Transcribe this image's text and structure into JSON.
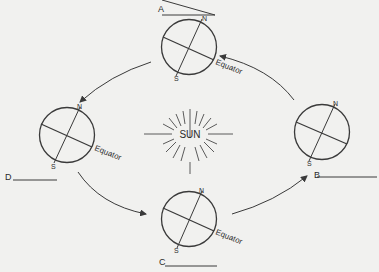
{
  "diagram": {
    "center_label": "SUN",
    "globes": [
      {
        "id": "A",
        "label": "A",
        "north": "N",
        "south": "S",
        "equator": "Equator",
        "answer_blank": ""
      },
      {
        "id": "B",
        "label": "B",
        "north": "N",
        "south": "S",
        "equator": "",
        "answer_blank": ""
      },
      {
        "id": "C",
        "label": "C",
        "north": "N",
        "south": "S",
        "equator": "Equator",
        "answer_blank": ""
      },
      {
        "id": "D",
        "label": "D",
        "north": "N",
        "south": "S",
        "equator": "Equator",
        "answer_blank": ""
      }
    ],
    "orbit_direction": "counterclockwise (A → D → C → B → A)",
    "colors": {
      "background": "#f1f1ef",
      "ink": "#3a3a3a"
    }
  }
}
